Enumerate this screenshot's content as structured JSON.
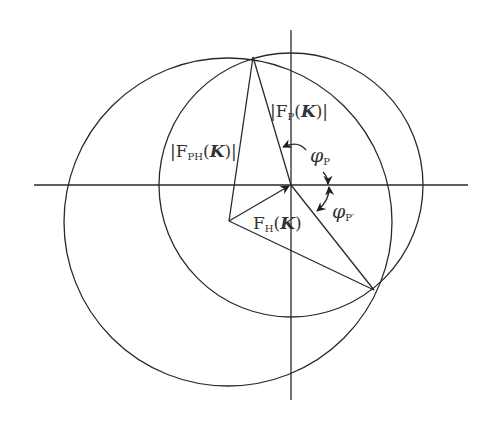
{
  "diagram": {
    "colors": {
      "line": "#2a2a2a",
      "text": "#333333",
      "background": "#ffffff"
    },
    "labels": {
      "fp": {
        "bar_l": "|",
        "F": "F",
        "sub": "P",
        "open": "(",
        "K": "K",
        "close": ")",
        "bar_r": "|"
      },
      "fph": {
        "bar_l": "|",
        "F": "F",
        "sub": "PH",
        "open": "(",
        "K": "K",
        "close": ")",
        "bar_r": "|"
      },
      "fh": {
        "F": "F",
        "sub": "H",
        "open": "(",
        "K": "K",
        "close": ")"
      },
      "phi_p": {
        "phi": "φ",
        "sub": "P"
      },
      "phi_p_prime": {
        "phi": "φ",
        "sub": "P′"
      }
    },
    "elements": [
      "horizontal-axis",
      "vertical-axis",
      "circle-centered-origin (radius |F_P(K)|)",
      "circle-centered-at -F_H (radius |F_PH(K)|)",
      "vector F_H(K)",
      "vector F_P",
      "vector F_PH",
      "alternative vector F_P′"
    ]
  }
}
